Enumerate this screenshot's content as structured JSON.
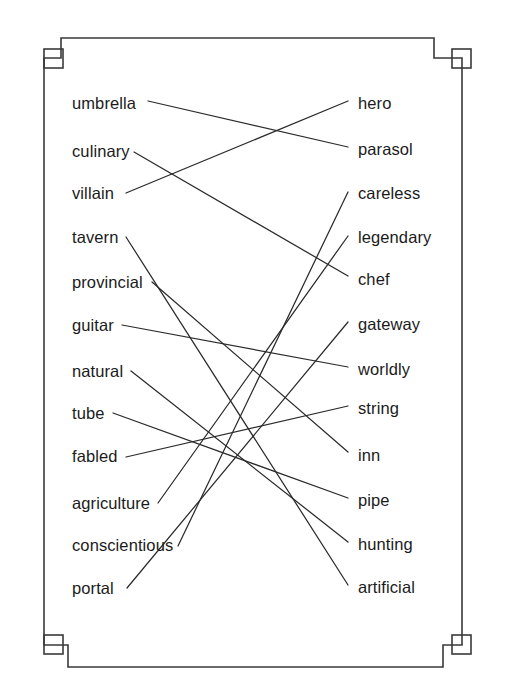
{
  "page": {
    "kind": "word-matching-worksheet",
    "background_color": "#ffffff",
    "ink_color": "#1b1b1b",
    "line_color": "#2b2b2b",
    "frame_color": "#3a3a3a"
  },
  "left_column": {
    "items": [
      {
        "label": "umbrella",
        "x": 72,
        "y": 104
      },
      {
        "label": "culinary",
        "x": 72,
        "y": 152
      },
      {
        "label": "villain",
        "x": 72,
        "y": 194
      },
      {
        "label": "tavern",
        "x": 72,
        "y": 238
      },
      {
        "label": "provincial",
        "x": 72,
        "y": 283
      },
      {
        "label": "guitar",
        "x": 72,
        "y": 326
      },
      {
        "label": "natural",
        "x": 72,
        "y": 372
      },
      {
        "label": "tube",
        "x": 72,
        "y": 414
      },
      {
        "label": "fabled",
        "x": 72,
        "y": 457
      },
      {
        "label": "agriculture",
        "x": 72,
        "y": 504
      },
      {
        "label": "conscientious",
        "x": 72,
        "y": 546
      },
      {
        "label": "portal",
        "x": 72,
        "y": 589
      }
    ]
  },
  "right_column": {
    "items": [
      {
        "label": "hero",
        "x": 358,
        "y": 104
      },
      {
        "label": "parasol",
        "x": 358,
        "y": 150
      },
      {
        "label": "careless",
        "x": 358,
        "y": 194
      },
      {
        "label": "legendary",
        "x": 358,
        "y": 238
      },
      {
        "label": "chef",
        "x": 358,
        "y": 280
      },
      {
        "label": "gateway",
        "x": 358,
        "y": 325
      },
      {
        "label": "worldly",
        "x": 358,
        "y": 370
      },
      {
        "label": "string",
        "x": 358,
        "y": 409
      },
      {
        "label": "inn",
        "x": 358,
        "y": 456
      },
      {
        "label": "pipe",
        "x": 358,
        "y": 501
      },
      {
        "label": "hunting",
        "x": 358,
        "y": 545
      },
      {
        "label": "artificial",
        "x": 358,
        "y": 588
      }
    ]
  },
  "connections": [
    {
      "from": "umbrella",
      "to": "parasol",
      "x1": 148,
      "y1": 101,
      "x2": 348,
      "y2": 147
    },
    {
      "from": "culinary",
      "to": "chef",
      "x1": 134,
      "y1": 152,
      "x2": 348,
      "y2": 276
    },
    {
      "from": "villain",
      "to": "hero",
      "x1": 126,
      "y1": 193,
      "x2": 348,
      "y2": 101
    },
    {
      "from": "tavern",
      "to": "artificial",
      "x1": 126,
      "y1": 237,
      "x2": 348,
      "y2": 585
    },
    {
      "from": "provincial",
      "to": "inn",
      "x1": 152,
      "y1": 282,
      "x2": 348,
      "y2": 452
    },
    {
      "from": "guitar",
      "to": "worldly",
      "x1": 122,
      "y1": 325,
      "x2": 348,
      "y2": 367
    },
    {
      "from": "natural",
      "to": "hunting",
      "x1": 131,
      "y1": 371,
      "x2": 348,
      "y2": 542
    },
    {
      "from": "tube",
      "to": "pipe",
      "x1": 113,
      "y1": 413,
      "x2": 348,
      "y2": 498
    },
    {
      "from": "fabled",
      "to": "string",
      "x1": 126,
      "y1": 457,
      "x2": 348,
      "y2": 406
    },
    {
      "from": "agriculture",
      "to": "legendary",
      "x1": 158,
      "y1": 503,
      "x2": 348,
      "y2": 236
    },
    {
      "from": "conscientious",
      "to": "careless",
      "x1": 178,
      "y1": 546,
      "x2": 348,
      "y2": 192
    },
    {
      "from": "portal",
      "to": "gateway",
      "x1": 127,
      "y1": 588,
      "x2": 348,
      "y2": 322
    }
  ],
  "frame": {
    "corners": [
      {
        "name": "top-left",
        "square_x": 42,
        "square_y": 50,
        "size": 19
      },
      {
        "name": "top-right",
        "square_x": 450,
        "square_y": 50,
        "size": 19
      },
      {
        "name": "bottom-left",
        "square_x": 42,
        "square_y": 627,
        "size": 19
      },
      {
        "name": "bottom-right",
        "square_x": 450,
        "square_y": 627,
        "size": 19
      }
    ],
    "outline_path": "M 26 70 L 26 648 L 67 648 L 67 668 L 439 668 L 439 648 L 480 648 L 480 70 L 439 70 L 439 38 L 67 38 L 67 70 Z"
  }
}
